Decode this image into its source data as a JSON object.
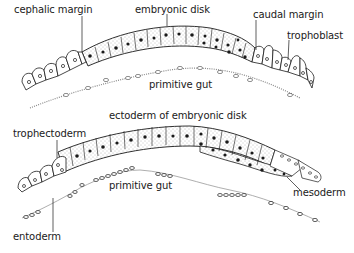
{
  "figure": {
    "top_section": {
      "labels": {
        "cephalic_margin": "cephalic margin",
        "embryonic_disk": "embryonic disk",
        "caudal_margin": "caudal margin",
        "trophoblast": "trophoblast",
        "primitive_gut": "primitive gut"
      }
    },
    "bottom_section": {
      "labels": {
        "ectoderm": "ectoderm of embryonic disk",
        "trophectoderm": "trophectoderm",
        "primitive_gut": "primitive gut",
        "mesoderm": "mesoderm",
        "entoderm": "entoderm"
      }
    },
    "colors": {
      "ink": "#1a1a1a",
      "stipple": "#9a9a9a",
      "background": "#ffffff"
    }
  }
}
